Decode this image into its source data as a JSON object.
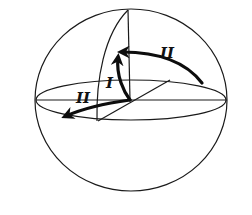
{
  "figure": {
    "type": "sphere-rotation-diagram",
    "colors": {
      "stroke": "#1a1a1a",
      "background": "#ffffff"
    },
    "sphere": {
      "cx": 131,
      "cy": 100,
      "rx": 96,
      "ry": 91
    },
    "equator": {
      "cx": 131,
      "cy": 100,
      "rx": 95,
      "ry": 20
    },
    "labels": {
      "rotation_one": "I",
      "rotation_two_upper": "II",
      "rotation_two_lower": "II"
    },
    "arrows": [
      {
        "id": "I",
        "description": "vertical rotation arc from center up along meridian"
      },
      {
        "id": "II-upper",
        "description": "arc from right equator up to pole-side point"
      },
      {
        "id": "II-lower",
        "description": "arc from center to left along equator"
      }
    ]
  },
  "caption": {
    "text": ""
  }
}
